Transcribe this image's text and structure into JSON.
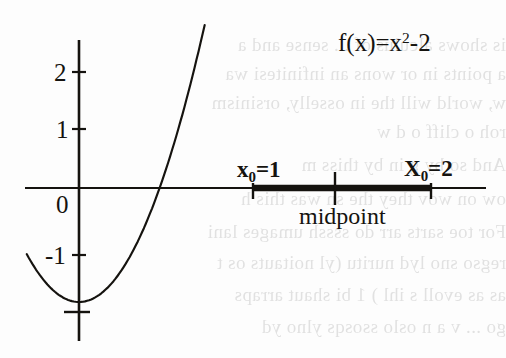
{
  "figure": {
    "kind": "math-function-graph",
    "background_color": "#fdfdfd",
    "ink_color": "#15130f",
    "bleedthrough_color": "#2b2b2b"
  },
  "chart_data": {
    "type": "line",
    "title": "",
    "function_label": "f(x)=x",
    "function_label_exponent": "2",
    "function_label_tail": "-2",
    "function_expression": "f(x)=x^2-2",
    "xlabel": "",
    "ylabel": "",
    "xlim": [
      -1.0,
      3.6
    ],
    "ylim": [
      -2.45,
      2.7
    ],
    "grid": false,
    "legend_position": "none",
    "y_tick_labels": [
      "2",
      "1",
      "0",
      "-1"
    ],
    "y_ticks": [
      2,
      1,
      0,
      -1
    ],
    "y_unlabeled_ticks": [
      -2
    ],
    "x_ticks_shown": [
      1,
      1.5,
      2
    ],
    "x_tick_labels_shown": [
      "",
      "",
      ""
    ],
    "x": [
      -0.95,
      -0.8,
      -0.6,
      -0.4,
      -0.2,
      0,
      0.2,
      0.4,
      0.6,
      0.8,
      1.0,
      1.2,
      1.4142,
      1.6,
      1.8,
      2.0,
      2.2,
      2.4,
      2.6,
      2.8,
      3.0,
      3.17
    ],
    "y": [
      -1.0975,
      -1.36,
      -1.64,
      -1.84,
      -1.96,
      -2.0,
      -1.96,
      -1.84,
      -1.64,
      -1.36,
      -1.0,
      -0.56,
      0.0,
      0.56,
      1.24,
      2.0,
      2.84,
      3.76,
      4.76,
      5.84,
      7.0,
      8.05
    ],
    "root": 1.4142,
    "vertex": [
      0,
      -2
    ],
    "annotations": [
      {
        "name": "left-endpoint",
        "text": "x",
        "subscript": "0",
        "tail": "=1",
        "full_text": "x0=1",
        "x_value": 1,
        "y_value": 0
      },
      {
        "name": "right-endpoint",
        "text": "X",
        "subscript": "0",
        "tail": "=2",
        "full_text": "X0=2",
        "x_value": 2,
        "y_value": 0
      },
      {
        "name": "midpoint",
        "text": "midpoint",
        "full_text": "midpoint",
        "x_value": 1.5,
        "y_value": 0
      }
    ],
    "interval_bar": {
      "from": 1,
      "to": 2,
      "midpoint_tick": 1.5,
      "description": "bold segment on x-axis from x0=1 to X0=2"
    }
  },
  "bleedthrough_lines": [
    "is shows alculus  of  ... sense  and a",
    "a points in or wons an infinitesi  wa",
    "w, world will the in osselly, orsinism",
    "roh o cliff o               d  w",
    "And so by  g in  by  thiss  m",
    "ow on wov they the sn was this h",
    "For  toe sarts arr do ssssh umages lani",
    "regso  sno lyd nuritu (yl noitauts os t",
    "as as evoll s  ihl )  1  bi shaut arraps",
    "go  ... v  a  n  oslo ssosqs ylno  yd"
  ]
}
